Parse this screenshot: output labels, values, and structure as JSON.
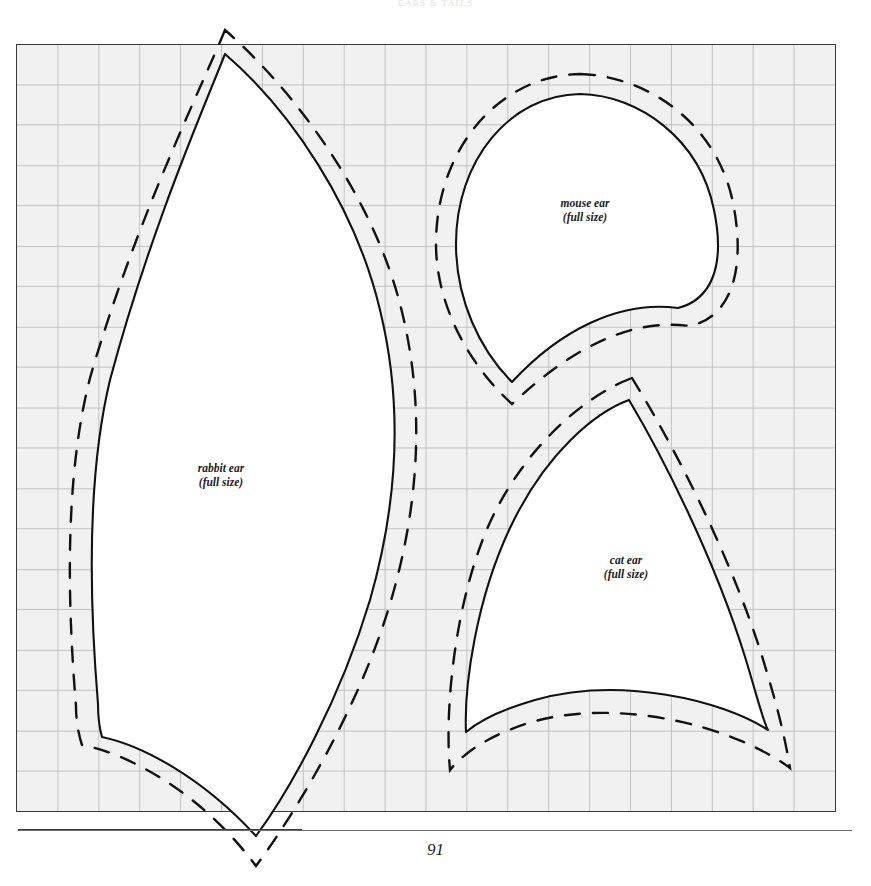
{
  "page": {
    "running_head": "EARS & TAILS",
    "folio": "91",
    "background_color": "#ffffff"
  },
  "grid_panel": {
    "name": "pattern-grid",
    "fill_color": "#f1f1f1",
    "border_color": "#3a3a3a",
    "grid_line_color": "#b9b9b9",
    "cell_size_px": 41,
    "left": 16,
    "top": 44,
    "width": 820,
    "height": 768
  },
  "lines": {
    "cutting_line_label": "cutting line",
    "cutting_line_color": "#111111",
    "cutting_line_style": "solid",
    "seam_line_label": "seam allowance line",
    "seam_line_color": "#111111",
    "seam_line_style": "dashed",
    "piece_fill_color": "#ffffff"
  },
  "pieces": [
    {
      "id": "rabbit-ear",
      "name": "rabbit ear",
      "size_note": "(full size)",
      "label_x": 221,
      "label_y": 468
    },
    {
      "id": "mouse-ear",
      "name": "mouse ear",
      "size_note": "(full size)",
      "label_x": 585,
      "label_y": 203
    },
    {
      "id": "cat-ear",
      "name": "cat ear",
      "size_note": "(full size)",
      "label_x": 626,
      "label_y": 560
    }
  ]
}
